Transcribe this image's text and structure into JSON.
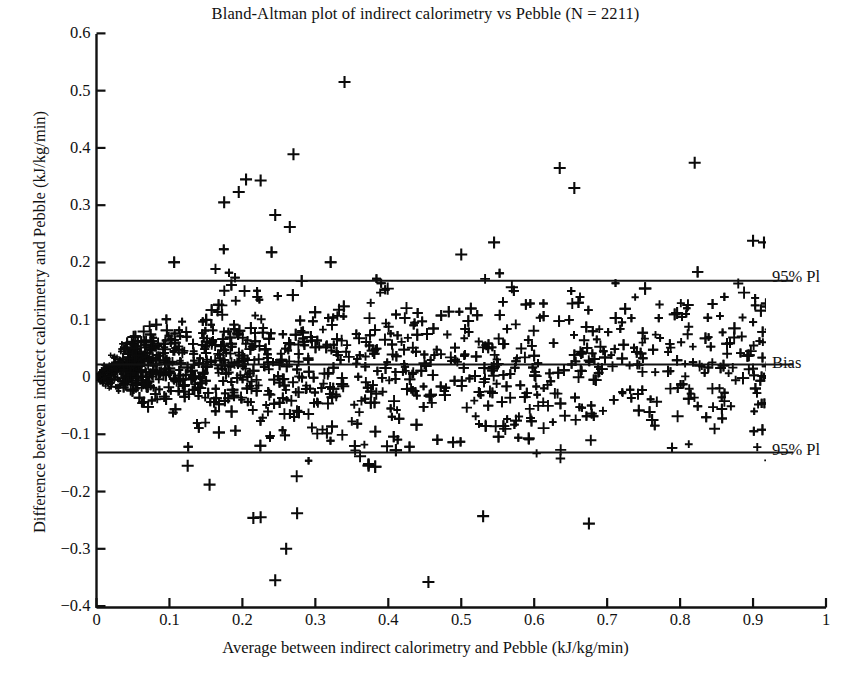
{
  "chart_data": {
    "type": "scatter",
    "title": "Bland-Altman plot of indirect calorimetry vs Pebble (N = 2211)",
    "xlabel": "Average between indirect calorimetry and Pebble (kJ/kg/min)",
    "ylabel": "Difference between indirect calorimetry and Pebble (kJ/kg/min)",
    "n": 2211,
    "marker": "plus",
    "marker_color": "#000000",
    "grid": false,
    "legend_position": "right-outside",
    "xlim": [
      0,
      1
    ],
    "ylim": [
      -0.4,
      0.6
    ],
    "xticks": [
      0,
      0.1,
      0.2,
      0.3,
      0.4,
      0.5,
      0.6,
      0.7,
      0.8,
      0.9,
      1
    ],
    "xtick_labels": [
      "0",
      "0.1",
      "0.2",
      "0.3",
      "0.4",
      "0.5",
      "0.6",
      "0.7",
      "0.8",
      "0.9",
      "1"
    ],
    "yticks": [
      0.6,
      0.5,
      0.4,
      0.3,
      0.2,
      0.1,
      0,
      -0.1,
      -0.2,
      -0.3,
      -0.4
    ],
    "ytick_labels": [
      "0.6",
      "0.5",
      "0.4",
      "0.3",
      "0.2",
      "0.1",
      "0",
      "−0.1",
      "−0.2",
      "−0.3",
      "−0.4"
    ],
    "reference_lines": [
      {
        "name": "upper-limit-of-agreement",
        "label": "95% Pl",
        "value": 0.168,
        "x_start": 0.0,
        "x_end": 0.955
      },
      {
        "name": "bias",
        "label": "Bias",
        "value": 0.022,
        "x_start": 0.0,
        "x_end": 0.955
      },
      {
        "name": "lower-limit-of-agreement",
        "label": "95% Pl",
        "value": -0.132,
        "x_start": 0.0,
        "x_end": 0.955
      }
    ],
    "notable_points": [
      {
        "x": 0.34,
        "y": 0.515
      },
      {
        "x": 0.27,
        "y": 0.389
      },
      {
        "x": 0.82,
        "y": 0.374
      },
      {
        "x": 0.635,
        "y": 0.365
      },
      {
        "x": 0.655,
        "y": 0.33
      },
      {
        "x": 0.205,
        "y": 0.345
      },
      {
        "x": 0.225,
        "y": 0.343
      },
      {
        "x": 0.195,
        "y": 0.323
      },
      {
        "x": 0.175,
        "y": 0.305
      },
      {
        "x": 0.545,
        "y": 0.235
      },
      {
        "x": 0.9,
        "y": 0.238
      },
      {
        "x": 0.915,
        "y": 0.235
      },
      {
        "x": 0.5,
        "y": 0.214
      },
      {
        "x": 0.265,
        "y": 0.262
      },
      {
        "x": 0.245,
        "y": 0.283
      },
      {
        "x": 0.275,
        "y": -0.238
      },
      {
        "x": 0.215,
        "y": -0.246
      },
      {
        "x": 0.225,
        "y": -0.245
      },
      {
        "x": 0.53,
        "y": -0.243
      },
      {
        "x": 0.675,
        "y": -0.256
      },
      {
        "x": 0.26,
        "y": -0.3
      },
      {
        "x": 0.245,
        "y": -0.355
      },
      {
        "x": 0.455,
        "y": -0.358
      },
      {
        "x": 0.155,
        "y": -0.188
      },
      {
        "x": 0.125,
        "y": -0.155
      }
    ],
    "series": [
      {
        "name": "indirect calorimetry vs Pebble differences",
        "point_count": 2211
      }
    ]
  },
  "annotations": {
    "upper_pi": "95% Pl",
    "bias": "Bias",
    "lower_pi": "95% Pl"
  }
}
